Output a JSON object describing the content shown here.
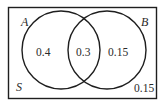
{
  "diagram": {
    "type": "venn",
    "universe_label": "S",
    "sets": [
      {
        "name": "A",
        "only_value": "0.4"
      },
      {
        "name": "B",
        "only_value": "0.15"
      }
    ],
    "intersection_value": "0.3",
    "outside_value": "0.15",
    "colors": {
      "stroke": "#1e1e1e",
      "text": "#2a2a2a",
      "background": "#ffffff"
    }
  }
}
